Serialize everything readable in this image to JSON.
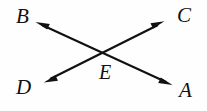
{
  "figure": {
    "background_color": "#fefefe",
    "stroke_color": "#111111",
    "labels": {
      "a": "A",
      "b": "B",
      "c": "C",
      "d": "D",
      "e": "E"
    },
    "points": {
      "A": {
        "x": 187,
        "y": 89
      },
      "B": {
        "x": 24,
        "y": 17
      },
      "C": {
        "x": 185,
        "y": 16
      },
      "D": {
        "x": 25,
        "y": 88
      },
      "E": {
        "x": 105,
        "y": 54
      }
    },
    "lines": [
      {
        "name": "line-d-c",
        "from": "D",
        "to": "C",
        "from_point": {
          "x": 45,
          "y": 82
        },
        "to_point": {
          "x": 163,
          "y": 22
        },
        "arrowheads": "both"
      },
      {
        "name": "line-b-a",
        "from": "B",
        "to": "A",
        "from_point": {
          "x": 36,
          "y": 22
        },
        "to_point": {
          "x": 172,
          "y": 85
        },
        "arrowheads": "both"
      }
    ],
    "intersection_label": "E"
  }
}
